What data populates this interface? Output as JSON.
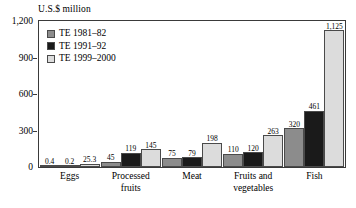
{
  "chart_data": {
    "type": "bar",
    "title": "",
    "ylabel": "U.S.$ million",
    "xlabel": "",
    "ylim": [
      0,
      1200
    ],
    "yticks": [
      "0",
      "300",
      "600",
      "900",
      "1,200"
    ],
    "ytick_values": [
      0,
      300,
      600,
      900,
      1200
    ],
    "grid": false,
    "legend_position": "top-left inside plot",
    "categories": [
      "Eggs",
      "Processed fruits",
      "Meat",
      "Fruits and vegetables",
      "Fish"
    ],
    "category_lines": [
      [
        "Eggs",
        ""
      ],
      [
        "Processed",
        "fruits"
      ],
      [
        "Meat",
        ""
      ],
      [
        "Fruits and",
        "vegetables"
      ],
      [
        "Fish",
        ""
      ]
    ],
    "series": [
      {
        "name": "TE 1981–82",
        "color": "#8c8c8c",
        "values": [
          0.4,
          45,
          75,
          110,
          320
        ],
        "labels": [
          "0.4",
          "45",
          "75",
          "110",
          "320"
        ]
      },
      {
        "name": "TE 1991–92",
        "color": "#1a1a1a",
        "values": [
          0.2,
          119,
          79,
          120,
          461
        ],
        "labels": [
          "0.2",
          "119",
          "79",
          "120",
          "461"
        ]
      },
      {
        "name": "TE 1999–2000",
        "color": "#dcdcdc",
        "values": [
          25.3,
          145,
          198,
          263,
          1125
        ],
        "labels": [
          "25.3",
          "145",
          "198",
          "263",
          "1,125"
        ]
      }
    ]
  }
}
